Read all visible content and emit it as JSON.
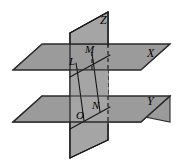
{
  "figure": {
    "canvas": {
      "width": 178,
      "height": 166
    },
    "colors": {
      "plane_fill": "#9b9b9b",
      "vertical_plane_fill": "#a5a5a5",
      "outline": "#2b2b2b",
      "line": "#151515",
      "background": "#ffffff"
    },
    "planes": [
      {
        "id": "plane-x",
        "label": "X",
        "kind": "horizontal-upper",
        "label_pos": {
          "x": 148,
          "y": 49
        },
        "points": "13,70 42,44 170,44 141,70"
      },
      {
        "id": "plane-y",
        "label": "Y",
        "kind": "horizontal-lower",
        "label_pos": {
          "x": 148,
          "y": 96
        },
        "points": "13,122 42,96 170,96 141,122"
      },
      {
        "id": "plane-z",
        "label": "Z",
        "kind": "vertical",
        "label_pos": {
          "x": 101,
          "y": 15
        },
        "points": "70,33 108,12 108,140 70,158"
      }
    ],
    "points": [
      {
        "id": "L",
        "label": "L",
        "x": 77,
        "y": 68,
        "label_pos": {
          "x": 70,
          "y": 57
        }
      },
      {
        "id": "M",
        "label": "M",
        "x": 93,
        "y": 59,
        "label_pos": {
          "x": 86,
          "y": 45
        }
      },
      {
        "id": "O",
        "label": "O",
        "x": 83,
        "y": 120,
        "label_pos": {
          "x": 77,
          "y": 110
        }
      },
      {
        "id": "N",
        "label": "N",
        "x": 99,
        "y": 111,
        "label_pos": {
          "x": 94,
          "y": 101
        }
      }
    ],
    "segments": [
      {
        "id": "seg-LO",
        "from": "L",
        "to": "O",
        "style": "solid"
      },
      {
        "id": "seg-MN",
        "from": "M",
        "to": "N",
        "style": "solid"
      }
    ],
    "intersection_lines": [
      {
        "id": "upper-intersection",
        "style": "solid",
        "from": {
          "x": 70,
          "y": 77
        },
        "to": {
          "x": 108,
          "y": 56
        }
      },
      {
        "id": "lower-intersection",
        "style": "solid",
        "from": {
          "x": 70,
          "y": 129
        },
        "to": {
          "x": 108,
          "y": 108
        }
      },
      {
        "id": "upper-back-edge",
        "style": "thin",
        "from": {
          "x": 70,
          "y": 51
        },
        "to": {
          "x": 108,
          "y": 51
        }
      },
      {
        "id": "lower-back-edge",
        "style": "thin",
        "from": {
          "x": 70,
          "y": 103
        },
        "to": {
          "x": 108,
          "y": 103
        }
      }
    ],
    "hidden_lines": [
      {
        "id": "vertical-hidden-right",
        "style": "dashed",
        "from": {
          "x": 108,
          "y": 51
        },
        "to": {
          "x": 108,
          "y": 126
        }
      },
      {
        "id": "hidden-MN-upper",
        "style": "dashed",
        "from": {
          "x": 93,
          "y": 52
        },
        "to": {
          "x": 93,
          "y": 70
        }
      }
    ],
    "labels": {
      "point_labels": [
        "L",
        "M",
        "O",
        "N"
      ],
      "plane_labels": [
        "X",
        "Y",
        "Z"
      ]
    }
  }
}
